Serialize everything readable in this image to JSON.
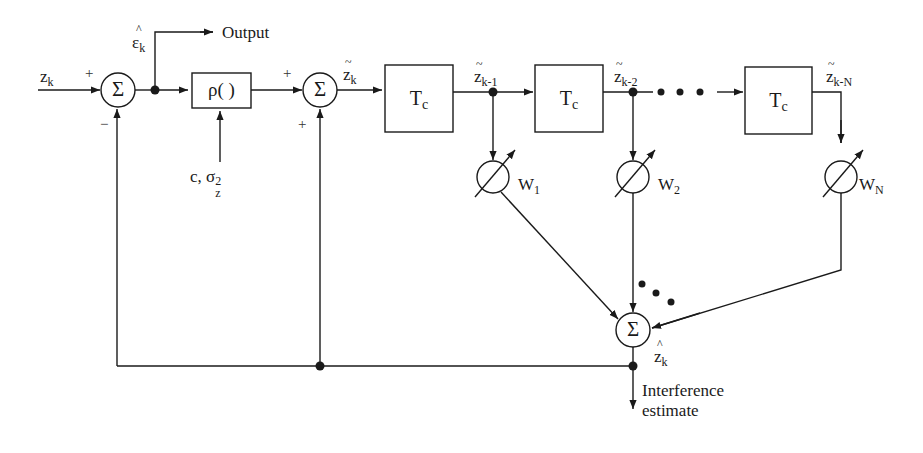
{
  "diagram": {
    "title": "",
    "input": {
      "symbol": "z",
      "subscript": "k",
      "sign": "+"
    },
    "summer1": {
      "glyph": "Σ",
      "sign_top": "+",
      "sign_bottom": "−"
    },
    "output_branch": {
      "symbol": "ε",
      "hat": "^",
      "subscript": "k",
      "label": "Output"
    },
    "nonlinearity": {
      "label": "ρ(   )",
      "params_prefix": "c, σ",
      "params_sup": "2",
      "params_sub": "z"
    },
    "summer2": {
      "glyph": "Σ",
      "sign_top": "+",
      "sign_bottom": "+"
    },
    "signal_zk": {
      "symbol": "z",
      "tilde": "~",
      "subscript": "k"
    },
    "delays": [
      {
        "label": "T",
        "subscript": "c"
      },
      {
        "label": "T",
        "subscript": "c"
      },
      {
        "label": "T",
        "subscript": "c"
      }
    ],
    "taps": [
      {
        "symbol": "z",
        "tilde": "~",
        "subscript": "k-1",
        "weight": "W",
        "weight_sub": "1"
      },
      {
        "symbol": "z",
        "tilde": "~",
        "subscript": "k-2",
        "weight": "W",
        "weight_sub": "2"
      },
      {
        "symbol": "z",
        "tilde": "~",
        "subscript": "k-N",
        "weight": "W",
        "weight_sub": "N"
      }
    ],
    "ellipsis": "• • •",
    "summer3": {
      "glyph": "Σ",
      "symbol": "z",
      "hat": "^",
      "subscript": "k"
    },
    "estimate_label_line1": "Interference",
    "estimate_label_line2": "estimate"
  }
}
